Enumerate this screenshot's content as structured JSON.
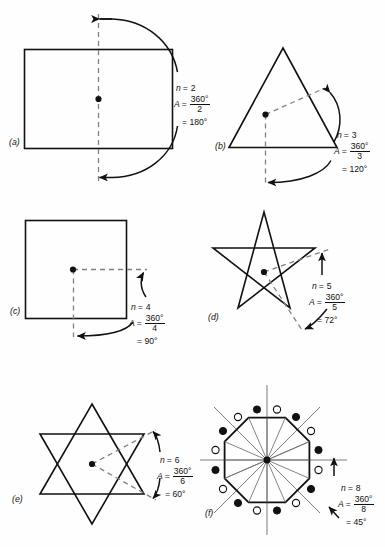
{
  "page": {
    "width": 385,
    "height": 547,
    "background": "#fefefe",
    "ink": "#111111",
    "thin_ink": "#7a7a7a"
  },
  "figures": [
    {
      "key": "a",
      "label": "(a)",
      "shape": "rectangle",
      "n_label": "n",
      "n_value": "2",
      "a_label": "A",
      "numerator": "360°",
      "denominator": "2",
      "result": "= 180°",
      "equals": "=",
      "center_marker": "center-dot"
    },
    {
      "key": "b",
      "label": "(b)",
      "shape": "equilateral-triangle",
      "n_label": "n",
      "n_value": "3",
      "a_label": "A",
      "numerator": "360°",
      "denominator": "3",
      "result": "= 120°",
      "equals": "=",
      "center_marker": "center-dot"
    },
    {
      "key": "c",
      "label": "(c)",
      "shape": "square",
      "n_label": "n",
      "n_value": "4",
      "a_label": "A",
      "numerator": "360°",
      "denominator": "4",
      "result": "= 90°",
      "equals": "=",
      "center_marker": "center-dot"
    },
    {
      "key": "d",
      "label": "(d)",
      "shape": "pentagram",
      "n_label": "n",
      "n_value": "5",
      "a_label": "A",
      "numerator": "360°",
      "denominator": "5",
      "result": "= 72°",
      "equals": "=",
      "center_marker": "center-dot"
    },
    {
      "key": "e",
      "label": "(e)",
      "shape": "hexagram",
      "n_label": "n",
      "n_value": "6",
      "a_label": "A",
      "numerator": "360°",
      "denominator": "6",
      "result": "= 60°",
      "equals": "=",
      "center_marker": "center-dot"
    },
    {
      "key": "f",
      "label": "(f)",
      "shape": "octagon-with-spokes",
      "n_label": "n",
      "n_value": "8",
      "a_label": "A",
      "numerator": "360°",
      "denominator": "8",
      "result": "= 45°",
      "equals": "=",
      "center_marker": "center-dot",
      "marker_count_filled": 8,
      "marker_count_open": 8,
      "spoke_count": 16
    }
  ]
}
